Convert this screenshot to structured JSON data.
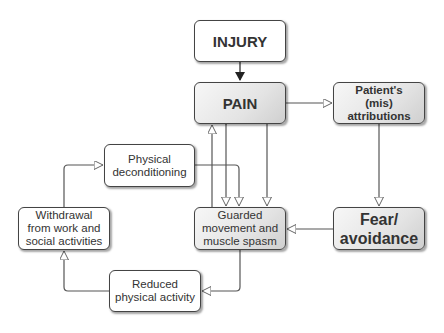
{
  "diagram": {
    "nodes": {
      "injury": {
        "label": "INJURY"
      },
      "pain": {
        "label": "PAIN"
      },
      "attributions": {
        "line1": "Patient's",
        "line2": "(mis) attributions"
      },
      "fear": {
        "line1": "Fear/",
        "line2": "avoidance"
      },
      "guarded": {
        "line1": "Guarded",
        "line2": "movement and",
        "line3": "muscle spasm"
      },
      "deconditioning": {
        "line1": "Physical",
        "line2": "deconditioning"
      },
      "withdrawal": {
        "line1": "Withdrawal",
        "line2": "from work and",
        "line3": "social activities"
      },
      "reduced": {
        "line1": "Reduced",
        "line2": "physical activity"
      }
    },
    "edges": [
      {
        "from": "INJURY",
        "to": "PAIN"
      },
      {
        "from": "PAIN",
        "to": "Patient's (mis) attributions"
      },
      {
        "from": "Patient's (mis) attributions",
        "to": "Fear/avoidance"
      },
      {
        "from": "Fear/avoidance",
        "to": "Guarded movement and muscle spasm"
      },
      {
        "from": "PAIN",
        "to": "Guarded movement and muscle spasm"
      },
      {
        "from": "Guarded movement and muscle spasm",
        "to": "PAIN"
      },
      {
        "from": "Guarded movement and muscle spasm",
        "to": "PAIN (second)"
      },
      {
        "from": "Guarded movement and muscle spasm",
        "to": "Reduced physical activity"
      },
      {
        "from": "Reduced physical activity",
        "to": "Withdrawal from work and social activities"
      },
      {
        "from": "Withdrawal from work and social activities",
        "to": "Physical deconditioning"
      },
      {
        "from": "Physical deconditioning",
        "to": "Guarded movement and muscle spasm"
      },
      {
        "from": "PAIN",
        "to": "Guarded movement and muscle spasm (via shared line)"
      }
    ]
  }
}
